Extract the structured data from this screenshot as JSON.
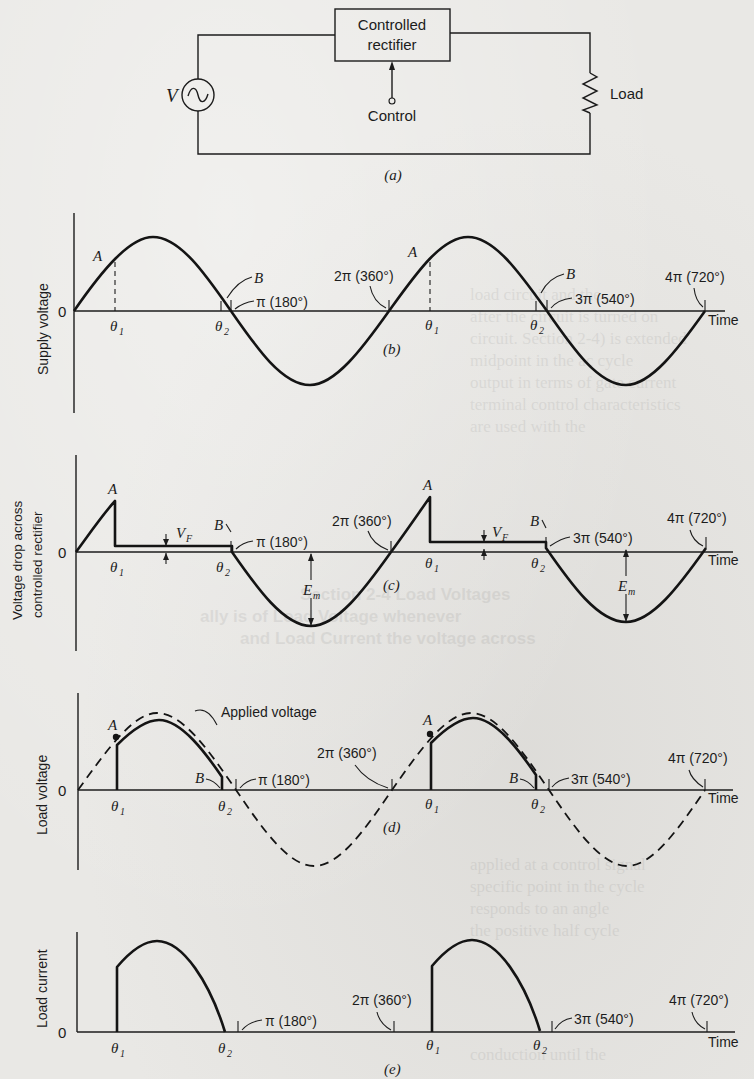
{
  "figure": {
    "circuit": {
      "source_label": "V",
      "box_label_line1": "Controlled",
      "box_label_line2": "rectifier",
      "control_label": "Control",
      "load_label": "Load",
      "caption": "(a)"
    },
    "panels": [
      {
        "id": "b",
        "ylabel": "Supply voltage",
        "caption": "(b)",
        "zero": "0",
        "point_a": "A",
        "point_b": "B",
        "theta1": "θ",
        "theta2": "θ",
        "sub1": "1",
        "sub2": "2",
        "pi": "π (180°)",
        "two_pi": "2π (360°)",
        "three_pi": "3π (540°)",
        "four_pi": "4π (720°)",
        "xlabel": "Time"
      },
      {
        "id": "c",
        "ylabel_line1": "Voltage drop across",
        "ylabel_line2": "controlled rectifier",
        "caption": "(c)",
        "zero": "0",
        "point_a": "A",
        "point_b": "B",
        "theta1": "θ",
        "theta2": "θ",
        "sub1": "1",
        "sub2": "2",
        "vf": "V",
        "vf_sub": "F",
        "em": "E",
        "em_sub": "m",
        "pi": "π (180°)",
        "two_pi": "2π (360°)",
        "three_pi": "3π (540°)",
        "four_pi": "4π (720°)",
        "xlabel": "Time"
      },
      {
        "id": "d",
        "ylabel": "Load voltage",
        "caption": "(d)",
        "zero": "0",
        "point_a": "A",
        "point_b": "B",
        "theta1": "θ",
        "theta2": "θ",
        "sub1": "1",
        "sub2": "2",
        "applied": "Applied voltage",
        "pi": "π (180°)",
        "two_pi": "2π (360°)",
        "three_pi": "3π (540°)",
        "four_pi": "4π (720°)",
        "xlabel": "Time"
      },
      {
        "id": "e",
        "ylabel": "Load current",
        "caption": "(e)",
        "zero": "0",
        "theta1": "θ",
        "theta2": "θ",
        "sub1": "1",
        "sub2": "2",
        "pi": "π (180°)",
        "two_pi": "2π (360°)",
        "three_pi": "3π (540°)",
        "four_pi": "4π (720°)",
        "xlabel": "Time"
      }
    ],
    "show_through_text": [
      "load circuit and the",
      "rectifier is turned off",
      "after the circuit is turned on",
      "circuit. Section 2-4) is extended",
      "midpoint in the ac cycle",
      "output in terms of gate current",
      "terminal control characteristics",
      "are used with the",
      "Section 2-4 Load Voltages",
      "ally is of Load Voltage whenever",
      "and Load Current the voltage across",
      "the load",
      "applied at a control signal",
      "specific point in the cycle",
      "responds to an angle",
      "the positive half cycle",
      "conduction until the"
    ]
  }
}
